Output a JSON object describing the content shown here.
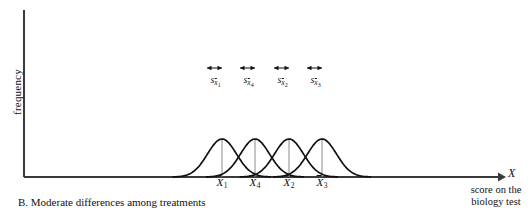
{
  "figure": {
    "caption": "B.  Moderate differences among treatments",
    "y_axis_label": "frequency",
    "x_axis_symbol": "X",
    "x_axis_description_line1": "score on the",
    "x_axis_description_line2": "biology test"
  },
  "means": [
    {
      "label_var": "X",
      "label_sub": "1"
    },
    {
      "label_var": "X",
      "label_sub": "4"
    },
    {
      "label_var": "X",
      "label_sub": "2"
    },
    {
      "label_var": "X",
      "label_sub": "3"
    }
  ],
  "sd_marks": [
    {
      "s": "s",
      "xbar": "x",
      "sub": "1"
    },
    {
      "s": "s",
      "xbar": "x",
      "sub": "4"
    },
    {
      "s": "s",
      "xbar": "x",
      "sub": "2"
    },
    {
      "s": "s",
      "xbar": "x",
      "sub": "3"
    }
  ],
  "colors": {
    "curve": "#111111",
    "axis": "#3a3a3a",
    "dropline": "#8a8a8a",
    "text": "#111111"
  },
  "chart_data": {
    "type": "line",
    "title": "B. Moderate differences among treatments",
    "xlabel": "X — score on the biology test",
    "ylabel": "frequency",
    "grid": false,
    "legend": "none",
    "axis_origin_px": [
      24,
      177
    ],
    "x_axis_end_px": 505,
    "y_axis_top_px": 10,
    "curve_peak_height_px": 38,
    "curve_baseline_px": 177,
    "curve_sigma_px": 14.5,
    "series": [
      {
        "name": "Treatment 1",
        "mean_px": 222,
        "mean_label": "X̄1",
        "sd_arrow_from_px": 207,
        "sd_arrow_to_px": 222,
        "sd_label": "s_x̄1"
      },
      {
        "name": "Treatment 4",
        "mean_px": 255,
        "mean_label": "X̄4",
        "sd_arrow_from_px": 240,
        "sd_arrow_to_px": 255,
        "sd_label": "s_x̄4"
      },
      {
        "name": "Treatment 2",
        "mean_px": 289,
        "mean_label": "X̄2",
        "sd_arrow_from_px": 274,
        "sd_arrow_to_px": 289,
        "sd_label": "s_x̄2"
      },
      {
        "name": "Treatment 3",
        "mean_px": 322,
        "mean_label": "X̄3",
        "sd_arrow_from_px": 307,
        "sd_arrow_to_px": 322,
        "sd_label": "s_x̄3"
      }
    ],
    "mean_spacing_px": 33.3,
    "xlim_px": [
      24,
      505
    ],
    "ylim": [
      0,
      1
    ]
  }
}
